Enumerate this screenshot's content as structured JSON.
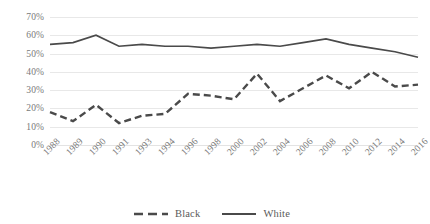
{
  "chart_data": {
    "type": "line",
    "title": "",
    "xlabel": "",
    "ylabel": "",
    "grid": true,
    "legend_position": "bottom",
    "ylim": [
      0,
      70
    ],
    "ytick_step": 10,
    "ytick_labels": [
      "70%",
      "60%",
      "50%",
      "40%",
      "30%",
      "20%",
      "10%",
      "0%"
    ],
    "ytick_values": [
      70,
      60,
      50,
      40,
      30,
      20,
      10,
      0
    ],
    "categories": [
      "1988",
      "1989",
      "1990",
      "1991",
      "1993",
      "1994",
      "1996",
      "1998",
      "2000",
      "2002",
      "2004",
      "2006",
      "2008",
      "2010",
      "2012",
      "2014",
      "2016"
    ],
    "series": [
      {
        "name": "Black",
        "style": "dashed",
        "color": "#4a4a4a",
        "values": [
          18,
          13,
          22,
          12,
          16,
          17,
          28,
          27,
          25,
          39,
          24,
          31,
          38,
          31,
          40,
          32,
          33
        ]
      },
      {
        "name": "White",
        "style": "solid",
        "color": "#4a4a4a",
        "values": [
          55,
          56,
          60,
          54,
          55,
          54,
          54,
          53,
          54,
          55,
          54,
          56,
          58,
          55,
          53,
          51,
          48
        ]
      }
    ]
  },
  "legend": {
    "items": [
      {
        "label": "Black",
        "style": "dashed"
      },
      {
        "label": "White",
        "style": "solid"
      }
    ]
  }
}
